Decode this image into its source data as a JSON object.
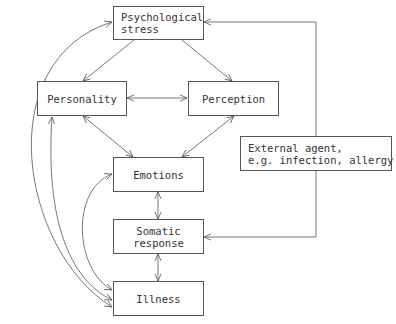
{
  "diagram": {
    "title": "",
    "nodes": {
      "stress": {
        "lines": [
          "Psychological",
          "stress"
        ]
      },
      "personality": {
        "lines": [
          "Personality"
        ]
      },
      "perception": {
        "lines": [
          "Perception"
        ]
      },
      "emotions": {
        "lines": [
          "Emotions"
        ]
      },
      "somatic": {
        "lines": [
          "Somatic",
          "response"
        ]
      },
      "illness": {
        "lines": [
          "Illness"
        ]
      },
      "external": {
        "lines": [
          "External agent,",
          "e.g. infection, allergy"
        ]
      }
    },
    "edges": [
      {
        "from": "Psychological stress",
        "to": "Personality",
        "direction": "one-way"
      },
      {
        "from": "Psychological stress",
        "to": "Perception",
        "direction": "one-way"
      },
      {
        "from": "Personality",
        "to": "Perception",
        "direction": "two-way"
      },
      {
        "from": "Personality",
        "to": "Emotions",
        "direction": "two-way"
      },
      {
        "from": "Perception",
        "to": "Emotions",
        "direction": "two-way"
      },
      {
        "from": "Emotions",
        "to": "Somatic response",
        "direction": "two-way"
      },
      {
        "from": "Somatic response",
        "to": "Illness",
        "direction": "two-way"
      },
      {
        "from": "Illness",
        "to": "Psychological stress",
        "direction": "two-way",
        "style": "curved"
      },
      {
        "from": "Illness",
        "to": "Personality",
        "direction": "two-way",
        "style": "curved"
      },
      {
        "from": "Illness",
        "to": "Emotions",
        "direction": "two-way",
        "style": "curved"
      },
      {
        "from": "External agent, e.g. infection, allergy",
        "to": "Psychological stress",
        "direction": "one-way",
        "style": "elbow"
      },
      {
        "from": "External agent, e.g. infection, allergy",
        "to": "Somatic response",
        "direction": "one-way",
        "style": "elbow"
      }
    ],
    "colors": {
      "line": "#555555",
      "text": "#333333",
      "background": "#ffffff"
    }
  }
}
